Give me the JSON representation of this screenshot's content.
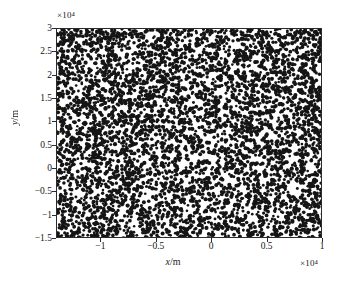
{
  "chart_data": {
    "type": "scatter",
    "title": "",
    "subtitle": "",
    "xlabel": "x/m",
    "ylabel": "y/m",
    "x_exponent_label": "×10⁴",
    "y_exponent_label": "×10⁴",
    "x_exponent_factor": 10000,
    "y_exponent_factor": 10000,
    "xlim": [
      -1.4,
      1.0
    ],
    "ylim": [
      -1.5,
      3.0
    ],
    "xticks": [
      -1,
      -0.5,
      0,
      0.5,
      1
    ],
    "xticklabels": [
      "−1",
      "−0.5",
      "0",
      "0.5",
      "1"
    ],
    "yticks": [
      -1.5,
      -1,
      -0.5,
      0,
      0.5,
      1,
      1.5,
      2,
      2.5,
      3
    ],
    "yticklabels": [
      "−1.5",
      "−1",
      "−0.5",
      "0",
      "0.5",
      "1",
      "1.5",
      "2",
      "2.5",
      "3"
    ],
    "grid": false,
    "legend": null,
    "series": [
      {
        "name": "scattered points",
        "marker": "dot",
        "marker_color": "#151515",
        "marker_size_px": 1.7,
        "point_count": 5200,
        "distribution": "uniform-random over full axes extent",
        "x_range": [
          -1.4,
          1.0
        ],
        "y_range": [
          -1.5,
          3.0
        ]
      }
    ],
    "annotations": []
  },
  "axes": {
    "frame_color": "#2b2b2b",
    "background_color": "#ffffff",
    "tick_color": "#2b2b2b"
  }
}
